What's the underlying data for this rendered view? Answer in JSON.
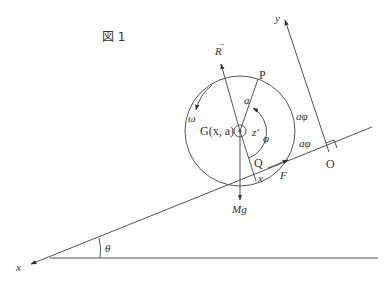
{
  "figure": {
    "caption": "図 1",
    "colors": {
      "line": "#555555",
      "text": "#333333",
      "background": "#ffffff"
    }
  },
  "labels": {
    "reaction_force": "R",
    "point_p": "P",
    "radius": "a",
    "angular_velocity": "ω",
    "center": "G(x, a)",
    "z_axis": "z′",
    "angle_phi": "φ",
    "arc_length_wheel": "aφ",
    "arc_length_ground": "aφ",
    "point_q": "Q",
    "contact_x": "x",
    "friction": "F",
    "gravity": "Mg",
    "origin": "O",
    "y_axis": "y",
    "x_axis": "x",
    "incline_angle": "θ"
  }
}
